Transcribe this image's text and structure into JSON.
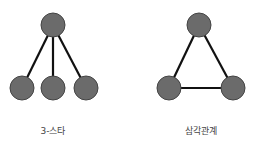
{
  "diagrams": [
    {
      "label": "3-스타",
      "type": "star",
      "nodes": [
        [
          53,
          25
        ],
        [
          22,
          88
        ],
        [
          53,
          88
        ],
        [
          86,
          88
        ]
      ],
      "edges": [
        [
          0,
          1
        ],
        [
          0,
          2
        ],
        [
          0,
          3
        ]
      ]
    },
    {
      "label": "삼각관계",
      "type": "triangle",
      "nodes": [
        [
          199,
          25
        ],
        [
          169,
          88
        ],
        [
          233,
          88
        ]
      ],
      "edges": [
        [
          0,
          1
        ],
        [
          0,
          2
        ],
        [
          1,
          2
        ]
      ]
    }
  ],
  "colors": {
    "node": "#6b6b6b",
    "edge": "#111111",
    "node_stroke": "#444444"
  }
}
